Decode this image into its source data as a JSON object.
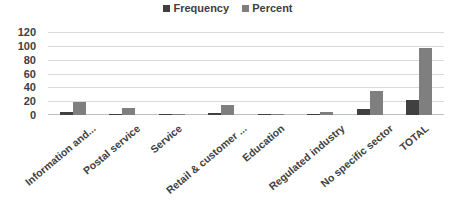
{
  "chart_data": {
    "type": "bar",
    "title": "",
    "xlabel": "",
    "ylabel": "",
    "ylim": [
      0,
      120
    ],
    "yticks": [
      0,
      20,
      40,
      60,
      80,
      100,
      120
    ],
    "grid": true,
    "legend_position": "top",
    "categories": [
      "Information and...",
      "Postal service",
      "Service",
      "Retail & customer ...",
      "Education",
      "Regulated industry",
      "No specific sector",
      "TOTAL"
    ],
    "series": [
      {
        "name": "Frequency",
        "color": "#404040",
        "values": [
          4,
          2,
          1,
          3,
          1,
          1,
          8,
          22
        ]
      },
      {
        "name": "Percent",
        "color": "#7f7f7f",
        "values": [
          19,
          10,
          2,
          14,
          2,
          5,
          35,
          97
        ]
      }
    ]
  }
}
